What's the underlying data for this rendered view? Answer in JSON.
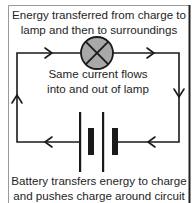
{
  "diagram": {
    "type": "series-circuit",
    "labels": {
      "top": "Energy transferred from charge to lamp and then to surroundings",
      "top_line1": "Energy transferred from charge to",
      "top_line2": "lamp and then to surroundings",
      "middle_line1": "Same current flows",
      "middle_line2": "into and out of lamp",
      "bottom_line1": "Battery transfers energy to charge",
      "bottom_line2": "and pushes charge around circuit"
    },
    "components": [
      {
        "name": "lamp",
        "symbol": "circle-with-cross",
        "fill": "#a8a8a8"
      },
      {
        "name": "battery",
        "symbol": "two-cells",
        "cells": 2
      }
    ],
    "current_direction": "clockwise",
    "arrows": [
      "top-left: right",
      "top-right: right",
      "right: down",
      "bottom-right: left",
      "bottom-left: left",
      "left: up"
    ],
    "colors": {
      "line": "#1a1a1a",
      "lamp_fill": "#a8a8a8",
      "frame_left": "#9a9a9a",
      "frame_right": "#222222"
    }
  }
}
